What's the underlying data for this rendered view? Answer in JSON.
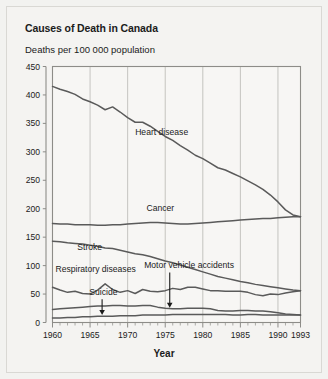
{
  "figure": {
    "title": "Causes of Death in Canada",
    "subtitle": "Deaths per 100 000 population",
    "xaxis_title": "Year",
    "background_color": "#f4f3f1",
    "frame_color": "#d9d8d4",
    "text_color": "#1b1b1b",
    "line_color": "#5a5a5a",
    "grid_color": "#b8b7b3"
  },
  "chart_data": {
    "type": "line",
    "title": "Causes of Death in Canada",
    "subtitle": "Deaths per 100 000 population",
    "xlabel": "Year",
    "ylabel": "Deaths per 100 000 population",
    "xlim": [
      1960,
      1993
    ],
    "ylim": [
      0,
      450
    ],
    "ytick_step": 50,
    "yticks": [
      0,
      50,
      100,
      150,
      200,
      250,
      300,
      350,
      400,
      450
    ],
    "xticks": [
      1960,
      1965,
      1970,
      1975,
      1980,
      1985,
      1990,
      1993
    ],
    "xtick_labels": [
      "1960",
      "1965",
      "1970",
      "1975",
      "1980",
      "1985",
      "1990",
      "1993"
    ],
    "minor_xticks_every": 1,
    "grid": "vertical gridlines at each major 5-year tick",
    "legend": "inline series labels placed on the plot",
    "x": [
      1960,
      1961,
      1962,
      1963,
      1964,
      1965,
      1966,
      1967,
      1968,
      1969,
      1970,
      1971,
      1972,
      1973,
      1974,
      1975,
      1976,
      1977,
      1978,
      1979,
      1980,
      1981,
      1982,
      1983,
      1984,
      1985,
      1986,
      1987,
      1988,
      1989,
      1990,
      1991,
      1992,
      1993
    ],
    "series": [
      {
        "name": "Heart disease",
        "label": "Heart disease",
        "label_x": 1971.0,
        "label_y": 330,
        "arrow": false,
        "values": [
          415,
          410,
          406,
          401,
          393,
          388,
          382,
          374,
          379,
          370,
          360,
          352,
          352,
          345,
          336,
          327,
          320,
          311,
          303,
          294,
          288,
          280,
          272,
          268,
          262,
          256,
          249,
          242,
          234,
          224,
          212,
          198,
          189,
          186
        ]
      },
      {
        "name": "Cancer",
        "label": "Cancer",
        "label_x": 1972.5,
        "label_y": 196,
        "arrow": false,
        "values": [
          174,
          173,
          173,
          172,
          172,
          172,
          171,
          171,
          172,
          172,
          173,
          174,
          175,
          176,
          176,
          175,
          174,
          173,
          173,
          174,
          175,
          176,
          177,
          178,
          179,
          180,
          181,
          182,
          183,
          183,
          184,
          185,
          186,
          186
        ]
      },
      {
        "name": "Stroke",
        "label": "Stroke",
        "label_x": 1963.3,
        "label_y": 128,
        "arrow": false,
        "values": [
          143,
          142,
          140,
          139,
          138,
          136,
          134,
          131,
          130,
          127,
          124,
          121,
          119,
          116,
          112,
          108,
          105,
          101,
          97,
          93,
          89,
          85,
          81,
          78,
          75,
          72,
          70,
          67,
          65,
          63,
          61,
          59,
          57,
          56
        ]
      },
      {
        "name": "Respiratory diseases",
        "label": "Respiratory diseases",
        "label_x": 1960.4,
        "label_y": 89,
        "arrow": false,
        "values": [
          62,
          57,
          53,
          55,
          51,
          50,
          57,
          68,
          58,
          53,
          56,
          51,
          58,
          55,
          54,
          56,
          60,
          58,
          62,
          62,
          59,
          56,
          56,
          55,
          55,
          55,
          53,
          49,
          47,
          50,
          49,
          52,
          54,
          56
        ]
      },
      {
        "name": "Motor vehicle accidents",
        "label": "Motor vehicle accidents",
        "label_x": 1972.2,
        "label_y": 96,
        "arrow": true,
        "arrow_x": 1975.6,
        "arrow_from_y": 88,
        "arrow_to_y": 26,
        "values": [
          23,
          24,
          25,
          26,
          27,
          28,
          29,
          29,
          30,
          30,
          29,
          29,
          30,
          30,
          27,
          25,
          24,
          24,
          25,
          25,
          25,
          24,
          21,
          20,
          20,
          21,
          21,
          20,
          20,
          19,
          17,
          15,
          14,
          13
        ]
      },
      {
        "name": "Suicide",
        "label": "Suicide",
        "label_x": 1964.9,
        "label_y": 48,
        "arrow": true,
        "arrow_x": 1966.6,
        "arrow_from_y": 41,
        "arrow_to_y": 13,
        "values": [
          8,
          8,
          9,
          9,
          10,
          10,
          11,
          11,
          11,
          12,
          12,
          12,
          13,
          13,
          13,
          13,
          14,
          14,
          14,
          14,
          14,
          14,
          14,
          14,
          13,
          13,
          14,
          14,
          13,
          13,
          13,
          13,
          13,
          13
        ]
      }
    ]
  }
}
